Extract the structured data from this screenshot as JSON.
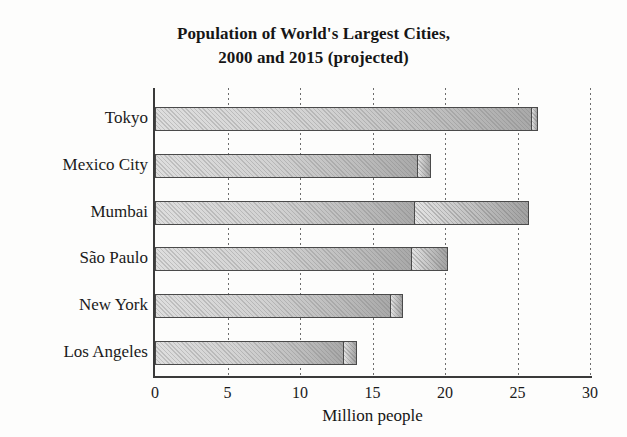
{
  "chart_data": {
    "type": "bar",
    "orientation": "horizontal",
    "stacked": true,
    "title": "Population of World's Largest Cities, 2000 and 2015 (projected)",
    "title_lines": [
      "Population of World's Largest Cities,",
      "2000 and 2015 (projected)"
    ],
    "xlabel": "Million people",
    "ylabel": "",
    "xlim": [
      0,
      30
    ],
    "xticks": [
      0,
      5,
      10,
      15,
      20,
      25,
      30
    ],
    "xtick_labels": [
      "0",
      "5",
      "10",
      "15",
      "20",
      "25",
      "30"
    ],
    "grid": "vertical-dotted",
    "legend": "none",
    "categories": [
      "Tokyo",
      "Mexico City",
      "Mumbai",
      "São Paulo",
      "New York",
      "Los Angeles"
    ],
    "series": [
      {
        "name": "2000",
        "values": [
          26.0,
          18.1,
          17.9,
          17.7,
          16.3,
          13.0
        ]
      },
      {
        "name": "2015 (projected) increment",
        "values": [
          0.4,
          0.9,
          7.9,
          2.5,
          0.8,
          0.9
        ]
      }
    ],
    "totals_2015": [
      26.4,
      19.0,
      25.8,
      20.2,
      17.1,
      13.9
    ],
    "colors": {
      "segment_2000": "#d2d2d2",
      "segment_2015": "#c4c4c4",
      "bar_border": "#4a4a4a",
      "axis": "#3a3a3a",
      "gridline": "#6d6d6d",
      "text": "#1a1a1a",
      "background": "#fdfdfc"
    }
  }
}
